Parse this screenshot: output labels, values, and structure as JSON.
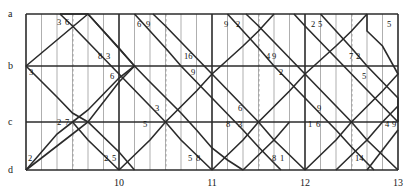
{
  "figure": {
    "type": "lattice-diagram",
    "title": "",
    "background": "#ffffff",
    "line_color": "#2b2b2b",
    "grid_color": "#8c8c8c",
    "dashed_color": "#9a9a9a"
  },
  "plot_box": {
    "left": 26,
    "top": 14,
    "right": 398,
    "bottom": 170
  },
  "rows": [
    {
      "label": "a",
      "y": 14
    },
    {
      "label": "b",
      "y": 66
    },
    {
      "label": "c",
      "y": 122
    },
    {
      "label": "d",
      "y": 170
    }
  ],
  "row_label_x": 8,
  "x_axis": {
    "ticks": [
      {
        "label": "10",
        "x": 119
      },
      {
        "label": "11",
        "x": 212
      },
      {
        "label": "12",
        "x": 305
      },
      {
        "label": "13",
        "x": 398
      }
    ],
    "label_y": 178,
    "minor_step": 15.5,
    "major_step": 93
  },
  "dashed_lines": [
    73,
    166,
    259,
    352
  ],
  "major_vlines": [
    26,
    119,
    212,
    305,
    398
  ],
  "minor_vlines": [
    41.5,
    57,
    72.5,
    88,
    103.5,
    134.5,
    150,
    165.5,
    181,
    196.5,
    227.5,
    243,
    258.5,
    274,
    289.5,
    320.5,
    336,
    351.5,
    367,
    382.5
  ],
  "zigzag": {
    "comment": "Polyline vertices in pixel coords for the woven diagonal paths",
    "paths": [
      [
        [
          26,
          66
        ],
        [
          88,
          14
        ],
        [
          134.5,
          66
        ],
        [
          119,
          82
        ],
        [
          88,
          122
        ],
        [
          72.5,
          134
        ],
        [
          26,
          170
        ]
      ],
      [
        [
          26,
          66
        ],
        [
          57,
          97
        ],
        [
          72.5,
          113
        ],
        [
          88,
          122
        ],
        [
          119,
          152
        ],
        [
          134.5,
          170
        ]
      ],
      [
        [
          88,
          14
        ],
        [
          103.5,
          31
        ],
        [
          119,
          48
        ],
        [
          134.5,
          66
        ],
        [
          150,
          82
        ],
        [
          181,
          113
        ],
        [
          196.5,
          130
        ],
        [
          212,
          148
        ],
        [
          227.5,
          160
        ],
        [
          243,
          170
        ]
      ],
      [
        [
          119,
          170
        ],
        [
          150,
          140
        ],
        [
          165.5,
          122
        ],
        [
          196.5,
          91
        ],
        [
          212,
          74
        ],
        [
          227.5,
          60
        ],
        [
          243,
          46
        ],
        [
          258.5,
          31
        ],
        [
          274,
          14
        ]
      ],
      [
        [
          134.5,
          14
        ],
        [
          150,
          31
        ],
        [
          165.5,
          48
        ],
        [
          181,
          66
        ],
        [
          196.5,
          82
        ],
        [
          212,
          98
        ],
        [
          227.5,
          114
        ],
        [
          243,
          130
        ],
        [
          258.5,
          147
        ],
        [
          274,
          163
        ],
        [
          281,
          170
        ]
      ],
      [
        [
          212,
          170
        ],
        [
          243,
          140
        ],
        [
          258.5,
          122
        ],
        [
          289.5,
          91
        ],
        [
          305,
          74
        ],
        [
          320.5,
          60
        ],
        [
          336,
          46
        ],
        [
          351.5,
          31
        ],
        [
          367,
          14
        ]
      ],
      [
        [
          227.5,
          14
        ],
        [
          243,
          31
        ],
        [
          258.5,
          48
        ],
        [
          274,
          66
        ],
        [
          289.5,
          82
        ],
        [
          305,
          98
        ],
        [
          320.5,
          114
        ],
        [
          336,
          130
        ],
        [
          351.5,
          147
        ],
        [
          367,
          163
        ],
        [
          374,
          170
        ]
      ],
      [
        [
          305,
          170
        ],
        [
          336,
          140
        ],
        [
          351.5,
          122
        ],
        [
          382.5,
          91
        ],
        [
          398,
          74
        ],
        [
          398,
          74
        ],
        [
          382.5,
          46
        ],
        [
          367,
          31
        ],
        [
          367,
          14
        ]
      ],
      [
        [
          320.5,
          14
        ],
        [
          336,
          31
        ],
        [
          351.5,
          48
        ],
        [
          367,
          66
        ],
        [
          382.5,
          82
        ],
        [
          398,
          98
        ],
        [
          398,
          122
        ]
      ],
      [
        [
          367,
          170
        ],
        [
          382.5,
          150
        ],
        [
          398,
          130
        ]
      ],
      [
        [
          26,
          170
        ],
        [
          41.5,
          152
        ],
        [
          57,
          134
        ],
        [
          72.5,
          122
        ],
        [
          88,
          110
        ],
        [
          103.5,
          94
        ],
        [
          119,
          78
        ],
        [
          134.5,
          66
        ]
      ],
      [
        [
          119,
          170
        ],
        [
          103.5,
          155
        ],
        [
          88,
          140
        ],
        [
          72.5,
          122
        ]
      ],
      [
        [
          212,
          170
        ],
        [
          196.5,
          155
        ],
        [
          181,
          140
        ],
        [
          165.5,
          122
        ],
        [
          150,
          106
        ],
        [
          134.5,
          90
        ],
        [
          119,
          74
        ],
        [
          103.5,
          58
        ],
        [
          88,
          42
        ],
        [
          72.5,
          26
        ],
        [
          60,
          14
        ]
      ],
      [
        [
          305,
          170
        ],
        [
          289.5,
          155
        ],
        [
          274,
          140
        ],
        [
          258.5,
          122
        ],
        [
          243,
          106
        ],
        [
          227.5,
          90
        ],
        [
          212,
          74
        ],
        [
          196.5,
          58
        ],
        [
          181,
          42
        ],
        [
          165.5,
          26
        ],
        [
          153,
          14
        ]
      ],
      [
        [
          398,
          170
        ],
        [
          382.5,
          155
        ],
        [
          367,
          140
        ],
        [
          351.5,
          122
        ],
        [
          336,
          106
        ],
        [
          320.5,
          90
        ],
        [
          305,
          74
        ],
        [
          289.5,
          58
        ],
        [
          274,
          42
        ],
        [
          258.5,
          26
        ],
        [
          246,
          14
        ]
      ],
      [
        [
          398,
          122
        ],
        [
          382.5,
          106
        ],
        [
          367,
          90
        ],
        [
          351.5,
          74
        ],
        [
          336,
          58
        ],
        [
          320.5,
          42
        ],
        [
          305,
          26
        ],
        [
          294,
          14
        ]
      ],
      [
        [
          60,
          14
        ],
        [
          88,
          14
        ]
      ],
      [
        [
          243,
          170
        ],
        [
          258.5,
          155
        ],
        [
          274,
          140
        ],
        [
          289.5,
          122
        ]
      ],
      [
        [
          336,
          170
        ],
        [
          351.5,
          155
        ],
        [
          367,
          140
        ],
        [
          382.5,
          122
        ],
        [
          398,
          106
        ]
      ]
    ]
  },
  "value_labels": [
    {
      "text": "3",
      "x": 57,
      "y": 18
    },
    {
      "text": "6",
      "x": 65,
      "y": 18
    },
    {
      "text": "8",
      "x": 98,
      "y": 52
    },
    {
      "text": "3",
      "x": 106,
      "y": 52
    },
    {
      "text": "3",
      "x": 29,
      "y": 68
    },
    {
      "text": "6",
      "x": 110,
      "y": 72
    },
    {
      "text": "2",
      "x": 57,
      "y": 118
    },
    {
      "text": "7",
      "x": 65,
      "y": 118
    },
    {
      "text": "2",
      "x": 28,
      "y": 154
    },
    {
      "text": "2",
      "x": 104,
      "y": 154
    },
    {
      "text": "5",
      "x": 112,
      "y": 154
    },
    {
      "text": "6",
      "x": 137,
      "y": 20
    },
    {
      "text": "9",
      "x": 146,
      "y": 20
    },
    {
      "text": "16",
      "x": 184,
      "y": 52
    },
    {
      "text": "9",
      "x": 191,
      "y": 68
    },
    {
      "text": "3",
      "x": 155,
      "y": 104
    },
    {
      "text": "5",
      "x": 143,
      "y": 120
    },
    {
      "text": "5",
      "x": 188,
      "y": 154
    },
    {
      "text": "8",
      "x": 196,
      "y": 154
    },
    {
      "text": "9",
      "x": 224,
      "y": 20
    },
    {
      "text": "2",
      "x": 236,
      "y": 20
    },
    {
      "text": "4",
      "x": 266,
      "y": 52
    },
    {
      "text": "9",
      "x": 272,
      "y": 52
    },
    {
      "text": "2",
      "x": 279,
      "y": 68
    },
    {
      "text": "6",
      "x": 238,
      "y": 104
    },
    {
      "text": "8",
      "x": 226,
      "y": 120
    },
    {
      "text": "3",
      "x": 238,
      "y": 120
    },
    {
      "text": "8",
      "x": 272,
      "y": 154
    },
    {
      "text": "1",
      "x": 280,
      "y": 154
    },
    {
      "text": "2",
      "x": 311,
      "y": 20
    },
    {
      "text": "5",
      "x": 318,
      "y": 20
    },
    {
      "text": "5",
      "x": 387,
      "y": 20
    },
    {
      "text": "7",
      "x": 349,
      "y": 52
    },
    {
      "text": "2",
      "x": 356,
      "y": 52
    },
    {
      "text": "5",
      "x": 362,
      "y": 72
    },
    {
      "text": "9",
      "x": 317,
      "y": 104
    },
    {
      "text": "1",
      "x": 308,
      "y": 120
    },
    {
      "text": "6",
      "x": 316,
      "y": 120
    },
    {
      "text": "4",
      "x": 385,
      "y": 120
    },
    {
      "text": "9",
      "x": 392,
      "y": 120
    },
    {
      "text": "14",
      "x": 355,
      "y": 154
    }
  ]
}
